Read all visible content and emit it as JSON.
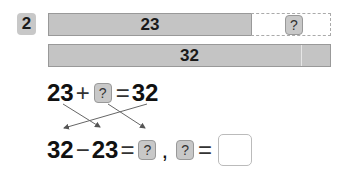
{
  "problem_number": "2",
  "bar_diagram": {
    "top_known_value": "23",
    "top_unknown_label": "?",
    "bottom_total_value": "32"
  },
  "equation_1": {
    "left": "23",
    "operator": "+",
    "unknown": "?",
    "equals": "=",
    "right": "32"
  },
  "equation_2": {
    "left": "32",
    "operator": "−",
    "middle": "23",
    "equals": "=",
    "unknown": "?",
    "separator": ",",
    "unknown_2": "?",
    "equals_2": "=",
    "answer": ""
  },
  "colors": {
    "bar_fill": "#c4c4c4",
    "question_box_fill": "#c8c8c8"
  }
}
